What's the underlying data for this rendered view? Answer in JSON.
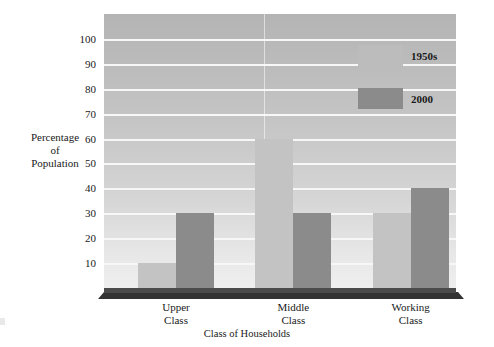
{
  "chart_data": {
    "type": "bar",
    "title": "",
    "xlabel": "Class of Households",
    "ylabel": "Percentage of Population",
    "ylabel_lines": [
      "Percentage",
      "of",
      "Population"
    ],
    "categories": [
      "Upper Class",
      "Middle Class",
      "Working Class"
    ],
    "category_lines": [
      [
        "Upper",
        "Class"
      ],
      [
        "Middle",
        "Class"
      ],
      [
        "Working",
        "Class"
      ]
    ],
    "series": [
      {
        "name": "1950s",
        "values": [
          10,
          60,
          30
        ],
        "color": "#c3c3c3"
      },
      {
        "name": "2000",
        "values": [
          30,
          30,
          40
        ],
        "color": "#8b8b8b"
      }
    ],
    "ylim": [
      0,
      110
    ],
    "yticks": [
      10,
      20,
      30,
      40,
      50,
      60,
      70,
      80,
      90,
      100
    ],
    "ytick_labels": [
      "10",
      "20",
      "30",
      "40",
      "50",
      "60",
      "70",
      "80",
      "90",
      "100"
    ],
    "grid": true,
    "grid_color": "#f7f7f7",
    "legend_position": "upper right inside",
    "plot_background": "vertical gray gradient, dark top to light bottom",
    "floor_color": "#333333"
  }
}
